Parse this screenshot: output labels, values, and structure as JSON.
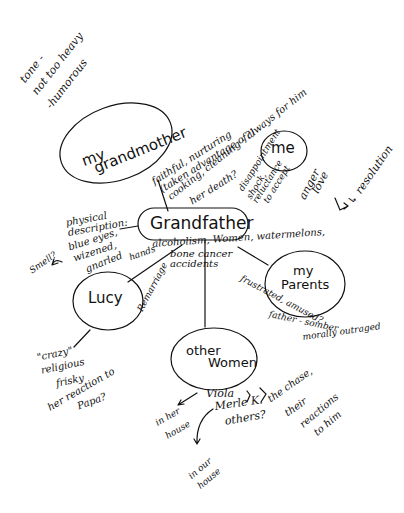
{
  "tone_note": {
    "line1": "tone -",
    "line2": "not too heavy",
    "line3": "-humorous"
  },
  "center_node": {
    "label": "Grandfather"
  },
  "nodes": {
    "grandmother": {
      "line1": "my",
      "line2": "grandmother"
    },
    "me": {
      "label": "me"
    },
    "parents": {
      "line1": "my",
      "line2": "Parents"
    },
    "lucy": {
      "label": "Lucy"
    },
    "other_women": {
      "line1": "other",
      "line2": "Women"
    }
  },
  "annotations": {
    "grandmother_traits": {
      "line1": "faithful, nurturing",
      "line2": "(taken advantage of?)",
      "line3": "cooking, cleaning - always for him",
      "line4": "her death?"
    },
    "me_feelings": {
      "line1": "disappointment",
      "line2": "shock,",
      "line3": "reluctance",
      "line4": "to accept",
      "line5": "anger",
      "line6": "love",
      "resolution": "↳ resolution"
    },
    "physical": {
      "line1": "physical",
      "line2": "description:",
      "line3": "blue eyes,",
      "line4": "wizened,",
      "line5": "gnarled",
      "hands": "hands",
      "smell": "Smell?"
    },
    "grandfather_traits": {
      "line1": "alcoholism, Women, watermelons,",
      "line2": "bone cancer",
      "line3": "accidents"
    },
    "lucy_link": "Remarriage",
    "lucy_traits": {
      "line1": "\"crazy\"",
      "line2": "religious",
      "line3": "frisky",
      "line4": "her reaction to",
      "line5": "Papa?"
    },
    "parents_traits": {
      "line1": "frustrated, amused?",
      "line2": "father - somber",
      "line3": "morally outraged"
    },
    "other_women_list": {
      "viola": "Viola",
      "merle": "Merle K.",
      "others": "others?",
      "chase1": "the chase,",
      "chase2": "their",
      "chase3": "reactions",
      "chase4": "to him",
      "her_house1": "in her",
      "her_house2": "house",
      "our_house1": "in our",
      "our_house2": "house"
    }
  }
}
